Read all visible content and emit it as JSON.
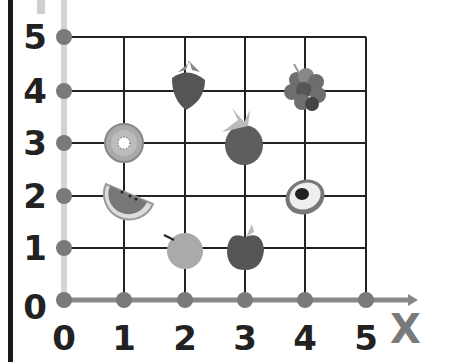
{
  "diagram": {
    "title": "",
    "x_axis_label": "X",
    "x_ticks": [
      "0",
      "1",
      "2",
      "3",
      "4",
      "5"
    ],
    "y_ticks": [
      "0",
      "1",
      "2",
      "3",
      "4",
      "5"
    ],
    "colors": {
      "grid": "#222222",
      "axis": "#888888",
      "y_axis": "#d4d4d4",
      "dot": "#7a7a7a"
    },
    "points": [
      {
        "name": "kiwi",
        "x": 1,
        "y": 3
      },
      {
        "name": "watermelon",
        "x": 1,
        "y": 2
      },
      {
        "name": "strawberry",
        "x": 2,
        "y": 4
      },
      {
        "name": "grapes",
        "x": 4,
        "y": 4
      },
      {
        "name": "raspberry",
        "x": 3,
        "y": 3
      },
      {
        "name": "avocado",
        "x": 4,
        "y": 2
      },
      {
        "name": "orange",
        "x": 2,
        "y": 1
      },
      {
        "name": "apple",
        "x": 3,
        "y": 1
      }
    ]
  }
}
